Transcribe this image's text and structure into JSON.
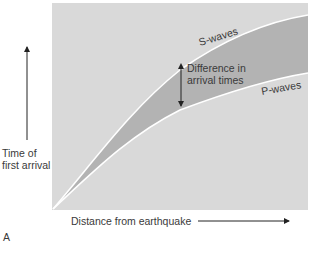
{
  "figure": {
    "panel_label": "A",
    "y_axis_label_line1": "Time of",
    "y_axis_label_line2": "first arrival",
    "x_axis_label": "Distance from earthquake",
    "s_wave_label": "S-waves",
    "p_wave_label": "P-waves",
    "difference_label_line1": "Difference in",
    "difference_label_line2": "arrival times"
  },
  "colors": {
    "plot_background": "#d9d9d9",
    "band_fill": "#b3b3b3",
    "curve_stroke": "#ffffff",
    "arrow_color": "#222222",
    "text_color": "#3a3a3a"
  }
}
